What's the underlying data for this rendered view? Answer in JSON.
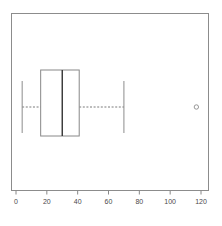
{
  "chart_data": {
    "type": "box",
    "orientation": "horizontal",
    "title": "",
    "xlabel": "",
    "ylabel": "",
    "xlim": [
      -8,
      128
    ],
    "grid": false,
    "legend": null,
    "xticks": [
      0,
      20,
      40,
      60,
      80,
      100,
      120
    ],
    "xticklabels": [
      "0",
      "20",
      "40",
      "60",
      "80",
      "100",
      "120"
    ],
    "frame": {
      "visible": true,
      "color": "#888888"
    },
    "series": [
      {
        "name": "box-1",
        "min_whisker": 4,
        "q1": 16,
        "median": 30,
        "q3": 41,
        "max_whisker": 70,
        "outliers": [
          117
        ],
        "box_color": "#ffffff",
        "edge_color": "#888888",
        "median_color": "#333333",
        "whisker_style": "dashed",
        "outlier_marker": "circle"
      }
    ]
  },
  "axis": {
    "tick_color": "#888888",
    "label_color": "#4a4a4a"
  }
}
